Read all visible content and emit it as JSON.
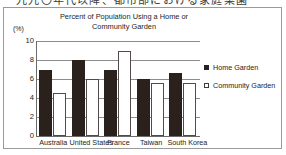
{
  "page": {
    "top_cropped_text": "一九九〇年代以降、都市部における家庭菜園"
  },
  "figure": {
    "unit_label": "(%)"
  },
  "legend": {
    "position": "right",
    "items": [
      {
        "label": "Home Garden",
        "marker": "filled-square",
        "color": "#2b211c"
      },
      {
        "label": "Community Garden",
        "marker": "open-square",
        "color": "#ffffff"
      }
    ]
  },
  "chart_data": {
    "type": "bar",
    "title": "Percent of Population Using a Home or Community Garden",
    "title_line1": "Percent of Population Using a Home or",
    "title_line2": "Community Garden",
    "xlabel": "",
    "ylabel": "(%)",
    "ylim": [
      0,
      10
    ],
    "yticks": [
      0,
      2,
      4,
      6,
      8,
      10
    ],
    "grid": true,
    "categories": [
      "Australia",
      "United States",
      "France",
      "Taiwan",
      "South Korea"
    ],
    "series": [
      {
        "name": "Home Garden",
        "color": "#2b211c",
        "values": [
          7,
          8,
          7,
          6,
          6.6
        ]
      },
      {
        "name": "Community Garden",
        "color": "#ffffff",
        "values": [
          4.5,
          6,
          9,
          5.6,
          5.6
        ]
      }
    ]
  }
}
